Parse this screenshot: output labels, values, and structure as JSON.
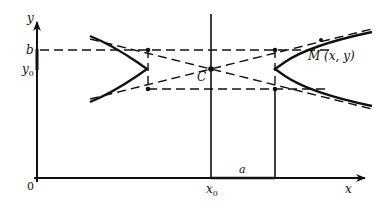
{
  "figure": {
    "type": "hyperbola-diagram",
    "labels": {
      "y_axis": "y",
      "x_axis": "x",
      "origin": "0",
      "b": "b",
      "y0": "y",
      "y0_sub": "0",
      "x0": "x",
      "x0_sub": "0",
      "a": "a",
      "center": "C",
      "point": "M (x, y)"
    },
    "colors": {
      "stroke": "#111111",
      "background": "#ffffff"
    }
  }
}
